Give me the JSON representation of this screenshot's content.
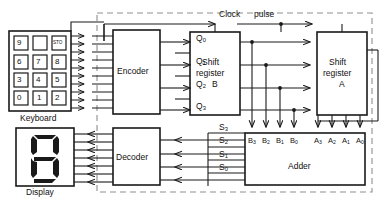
{
  "diagram": {
    "boundary": {
      "name": "system-boundary",
      "style": "dashed"
    },
    "clock": {
      "label_1": "Clock",
      "label_2": "pulse"
    },
    "blocks": [
      {
        "id": "keyboard",
        "label": "Keyboard"
      },
      {
        "id": "encoder",
        "label": "Encoder"
      },
      {
        "id": "shift-register-b",
        "line1": "Shift",
        "line2": "register",
        "line3": "B"
      },
      {
        "id": "shift-register-a",
        "line1": "Shift",
        "line2": "register",
        "line3": "A"
      },
      {
        "id": "adder",
        "label": "Adder"
      },
      {
        "id": "decoder",
        "label": "Decoder"
      },
      {
        "id": "display",
        "label": "Display"
      }
    ],
    "keypad": {
      "name": "keyboard-keypad",
      "rows": [
        [
          "9",
          "",
          "STO"
        ],
        [
          "6",
          "7",
          "8"
        ],
        [
          "3",
          "4",
          "5"
        ],
        [
          "0",
          "1",
          "2"
        ]
      ]
    },
    "display": {
      "digit": "8",
      "segments": "seven-segment"
    },
    "encoder_outputs": [
      {
        "label": "Q",
        "sub": "0"
      },
      {
        "label": "Q",
        "sub": "1"
      },
      {
        "label": "Q",
        "sub": "2"
      },
      {
        "label": "Q",
        "sub": "3"
      }
    ],
    "adder_inputs_b": [
      {
        "label": "B",
        "sub": "3"
      },
      {
        "label": "B",
        "sub": "2"
      },
      {
        "label": "B",
        "sub": "1"
      },
      {
        "label": "B",
        "sub": "0"
      }
    ],
    "adder_inputs_a": [
      {
        "label": "A",
        "sub": "3"
      },
      {
        "label": "A",
        "sub": "2"
      },
      {
        "label": "A",
        "sub": "1"
      },
      {
        "label": "A",
        "sub": "0"
      }
    ],
    "sum_outputs": [
      {
        "label": "S",
        "sub": "3"
      },
      {
        "label": "S",
        "sub": "2"
      },
      {
        "label": "S",
        "sub": "1"
      },
      {
        "label": "S",
        "sub": "0"
      }
    ],
    "bus_widths": {
      "keyboard_to_encoder": 10,
      "decoder_to_display": 7,
      "adder_to_decoder": 4
    },
    "colors": {
      "line": "#1a1a1a",
      "boundary": "#8a8a8a",
      "text": "#111111",
      "background": "#ffffff"
    }
  }
}
